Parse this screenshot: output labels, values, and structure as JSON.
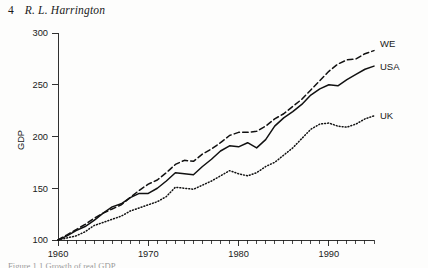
{
  "page": {
    "folio": "4",
    "running_head": "R. L. Harrington",
    "caption_fragment": "Figure 1.1  Growth of real GDP"
  },
  "chart_data": {
    "type": "line",
    "title": "",
    "xlabel": "",
    "ylabel": "GDP",
    "xlim": [
      1960,
      1995
    ],
    "ylim": [
      100,
      300
    ],
    "ytick_labels": [
      "100",
      "150",
      "200",
      "250",
      "300"
    ],
    "ytick_values": [
      100,
      150,
      200,
      250,
      300
    ],
    "xtick_labels": [
      "1960",
      "1970",
      "1980",
      "1990"
    ],
    "xtick_values": [
      1960,
      1970,
      1980,
      1990
    ],
    "minor_xtick_interval": 1,
    "grid": false,
    "legend_position": "right-inline",
    "index_base": "1960 = 100",
    "x": [
      1960,
      1961,
      1962,
      1963,
      1964,
      1965,
      1966,
      1967,
      1968,
      1969,
      1970,
      1971,
      1972,
      1973,
      1974,
      1975,
      1976,
      1977,
      1978,
      1979,
      1980,
      1981,
      1982,
      1983,
      1984,
      1985,
      1986,
      1987,
      1988,
      1989,
      1990,
      1991,
      1992,
      1993,
      1994,
      1995
    ],
    "series": [
      {
        "name": "WE",
        "label": "WE",
        "style": "dashed",
        "color": "#111111",
        "values": [
          100,
          105,
          110,
          115,
          121,
          126,
          130,
          134,
          141,
          148,
          154,
          158,
          165,
          173,
          177,
          176,
          183,
          188,
          194,
          201,
          204,
          204,
          205,
          210,
          217,
          222,
          229,
          236,
          245,
          254,
          263,
          270,
          274,
          275,
          280,
          283
        ]
      },
      {
        "name": "USA",
        "label": "USA",
        "style": "solid",
        "color": "#111111",
        "values": [
          100,
          104,
          109,
          113,
          119,
          126,
          132,
          135,
          141,
          145,
          145,
          150,
          157,
          165,
          164,
          163,
          171,
          178,
          186,
          191,
          190,
          194,
          189,
          197,
          210,
          218,
          224,
          231,
          240,
          246,
          250,
          249,
          255,
          260,
          265,
          268
        ]
      },
      {
        "name": "UK",
        "label": "UK",
        "style": "dotted",
        "color": "#111111",
        "values": [
          100,
          102,
          104,
          108,
          114,
          117,
          120,
          123,
          128,
          131,
          134,
          137,
          142,
          151,
          150,
          149,
          153,
          157,
          162,
          167,
          164,
          162,
          165,
          171,
          175,
          182,
          189,
          198,
          207,
          212,
          213,
          210,
          209,
          212,
          217,
          220
        ]
      }
    ]
  }
}
